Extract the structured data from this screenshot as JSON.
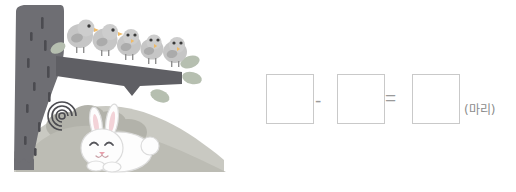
{
  "page": {
    "width": 516,
    "height": 192,
    "background_color": "#ffffff"
  },
  "illustration": {
    "name": "birds-on-branch-with-rabbit",
    "description": "Five gray birds perched on a tree branch; a white rabbit rests on a hill beneath the tree",
    "colors": {
      "trunk": "#6e6e73",
      "trunk_mark": "#4a4a4f",
      "branch": "#5f5f64",
      "leaf": "#b4bdae",
      "bird_body": "#c4c4c4",
      "bird_wing": "#a9a9a9",
      "bird_beak": "#f0bd6a",
      "bird_eye": "#3a3a3a",
      "bird_leg": "#8f8f8f",
      "rabbit_body": "#fdfdfd",
      "rabbit_outline": "#dcdcdc",
      "rabbit_ear_inner": "#f3d3d8",
      "rabbit_nose": "#e8a0ac",
      "rabbit_eye": "#55555a",
      "hill_front": "#b9b9b1",
      "hill_back": "#c9c9c2",
      "bush": "#b0b0a8"
    },
    "birds": [
      {
        "id": "bird-1",
        "label": "bird"
      },
      {
        "id": "bird-2",
        "label": "bird"
      },
      {
        "id": "bird-3",
        "label": "bird"
      },
      {
        "id": "bird-4",
        "label": "bird"
      },
      {
        "id": "bird-5",
        "label": "bird"
      }
    ],
    "bird_count": 5,
    "rabbit": {
      "id": "rabbit-1",
      "label": "rabbit"
    }
  },
  "equation": {
    "boxes": [
      {
        "name": "minuend-box",
        "value": "",
        "placeholder": ""
      },
      {
        "name": "subtrahend-box",
        "value": "",
        "placeholder": ""
      },
      {
        "name": "result-box",
        "value": "",
        "placeholder": ""
      }
    ],
    "minus": "-",
    "equals": "=",
    "unit": "(마리)",
    "box_border_color": "#c9c9c9",
    "sign_color": "#9a9a9a",
    "unit_color": "#8c8c8c"
  }
}
